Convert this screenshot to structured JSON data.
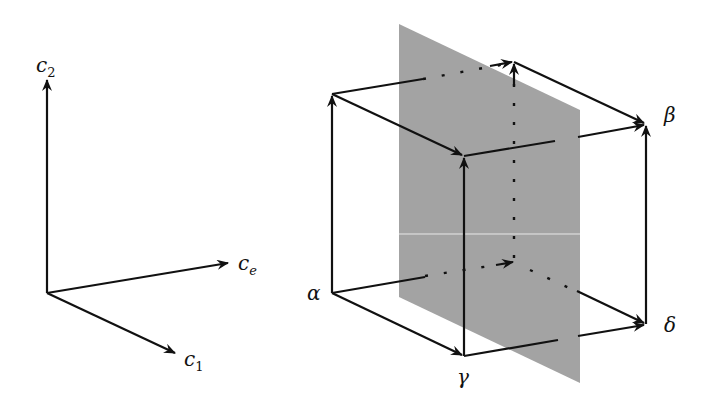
{
  "axes": {
    "origin": [
      47,
      293
    ],
    "c2": {
      "base": "c",
      "subscript": "2",
      "tip": [
        47,
        100
      ]
    },
    "ce": {
      "base": "c",
      "subscript": "e",
      "tip": [
        228,
        263
      ]
    },
    "c1": {
      "base": "c",
      "subscript": "1",
      "tip": [
        175,
        353
      ]
    }
  },
  "cube": {
    "vertices": {
      "alpha": {
        "label": "α",
        "pos": [
          332,
          293
        ]
      },
      "gamma": {
        "label": "γ",
        "pos": [
          464,
          356
        ]
      },
      "delta": {
        "label": "δ",
        "pos": [
          646,
          324
        ]
      },
      "back_bottom": {
        "pos": [
          514,
          262
        ]
      },
      "top_left": {
        "pos": [
          332,
          94
        ]
      },
      "top_front": {
        "pos": [
          464,
          156
        ]
      },
      "beta": {
        "label": "β",
        "pos": [
          646,
          124
        ]
      },
      "back_top": {
        "pos": [
          514,
          62
        ]
      }
    }
  },
  "plane": {
    "color": "#a3a3a3",
    "corners": [
      [
        399,
        24
      ],
      [
        580,
        110
      ],
      [
        580,
        383
      ],
      [
        399,
        297
      ]
    ]
  }
}
